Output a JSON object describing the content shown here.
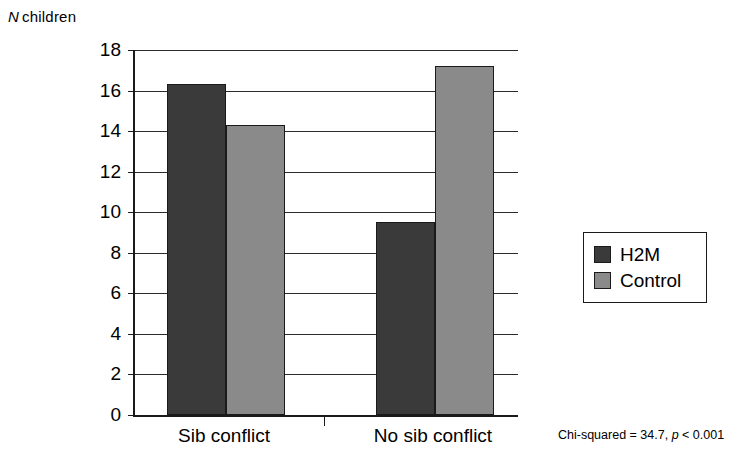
{
  "chart_data": {
    "type": "bar",
    "title": "",
    "ylabel": "N children",
    "ylabel_italic_prefix": "N",
    "ylabel_rest": "children",
    "xlabel": "",
    "categories": [
      "Sib conflict",
      "No sib conflict"
    ],
    "series": [
      {
        "name": "H2M",
        "color": "#3a3a3a",
        "values": [
          16.3,
          9.5
        ]
      },
      {
        "name": "Control",
        "color": "#8a8a8a",
        "values": [
          14.3,
          17.2
        ]
      }
    ],
    "ylim": [
      0,
      18
    ],
    "ytick_step": 2,
    "yticks": [
      0,
      2,
      4,
      6,
      8,
      10,
      12,
      14,
      16,
      18
    ],
    "grid": true,
    "legend_position": "right",
    "annotation": {
      "prefix": "Chi-squared = 34.7, ",
      "italic": "p",
      "suffix": " < 0.001",
      "full": "Chi-squared = 34.7, p < 0.001"
    }
  },
  "legend": {
    "items": [
      {
        "label": "H2M",
        "color": "#3a3a3a"
      },
      {
        "label": "Control",
        "color": "#8a8a8a"
      }
    ]
  },
  "colors": {
    "series_dark": "#3a3a3a",
    "series_light": "#8a8a8a",
    "axis": "#1a1a1a",
    "grid": "#2b2b2b",
    "background": "#ffffff"
  }
}
